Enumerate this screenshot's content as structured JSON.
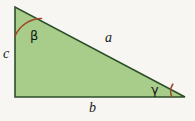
{
  "figure": {
    "name": "right-triangle-with-labeled-sides-and-angles",
    "background_color": "#f7f6f3",
    "canvas": {
      "width": 195,
      "height": 121
    }
  },
  "triangle": {
    "fill_color": "#a8cd8a",
    "stroke_color": "#2c4f2a",
    "stroke_width": 1.6,
    "vertices": {
      "top_left": {
        "x": 15,
        "y": 7
      },
      "bottom_left": {
        "x": 15,
        "y": 97
      },
      "bottom_right": {
        "x": 185,
        "y": 97
      }
    },
    "points_attr": "15,7 15,97 185,97"
  },
  "sides": [
    {
      "id": "side-a",
      "label": "a",
      "role": "hypotenuse",
      "from": "top_left",
      "to": "bottom_right",
      "label_position": {
        "x": 105,
        "y": 31
      }
    },
    {
      "id": "side-b",
      "label": "b",
      "role": "base",
      "from": "bottom_left",
      "to": "bottom_right",
      "label_position": {
        "x": 89,
        "y": 101
      }
    },
    {
      "id": "side-c",
      "label": "c",
      "role": "vertical-leg",
      "from": "top_left",
      "to": "bottom_left",
      "label_position": {
        "x": 3,
        "y": 47
      }
    }
  ],
  "angles": [
    {
      "id": "angle-beta",
      "label": "β",
      "name": "beta",
      "vertex": "top_left",
      "arc_color": "#9c4a28",
      "arc_width": 1.6,
      "arc_path": "M 15 36 A 29 29 0 0 1 41.5 18.5",
      "label_position": {
        "x": 30,
        "y": 29
      }
    },
    {
      "id": "angle-gamma",
      "label": "γ",
      "name": "gamma",
      "vertex": "bottom_right",
      "arc_color": "#9c4a28",
      "arc_width": 1.6,
      "arc_path": "M 172 97 A 13 13 0 0 1 172.8 84.2",
      "label_position": {
        "x": 151,
        "y": 83
      }
    }
  ],
  "right_angle": {
    "id": "right-angle-marker",
    "vertex": "bottom_left",
    "shown": false
  }
}
